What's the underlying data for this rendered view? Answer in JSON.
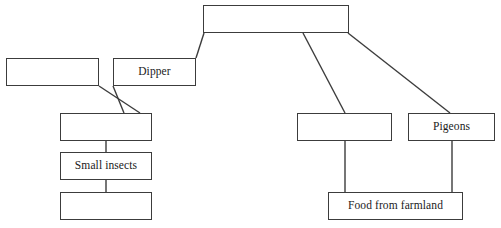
{
  "diagram": {
    "type": "food-web-fill-in-the-blank",
    "background_color": "#ffffff",
    "box_border_color": "#3c3c3c",
    "link_color": "#3c3c3c",
    "text_color": "#1a1a1a",
    "nodes": [
      {
        "id": "top",
        "label": "",
        "x": 203,
        "y": 5,
        "w": 146,
        "h": 28,
        "blank": true
      },
      {
        "id": "left-upper",
        "label": "",
        "x": 6,
        "y": 58,
        "w": 93,
        "h": 28,
        "blank": true
      },
      {
        "id": "dipper",
        "label": "Dipper",
        "x": 113,
        "y": 58,
        "w": 83,
        "h": 28,
        "blank": false
      },
      {
        "id": "left-mid",
        "label": "",
        "x": 60,
        "y": 113,
        "w": 92,
        "h": 28,
        "blank": true
      },
      {
        "id": "small-insects",
        "label": "Small insects",
        "x": 60,
        "y": 152,
        "w": 92,
        "h": 28,
        "blank": false
      },
      {
        "id": "left-bottom",
        "label": "",
        "x": 60,
        "y": 192,
        "w": 92,
        "h": 28,
        "blank": true
      },
      {
        "id": "right-mid",
        "label": "",
        "x": 297,
        "y": 113,
        "w": 95,
        "h": 28,
        "blank": true
      },
      {
        "id": "pigeons",
        "label": "Pigeons",
        "x": 408,
        "y": 113,
        "w": 87,
        "h": 28,
        "blank": false
      },
      {
        "id": "food-from-farmland",
        "label": "Food from farmland",
        "x": 328,
        "y": 192,
        "w": 135,
        "h": 28,
        "blank": false
      }
    ],
    "links": [
      {
        "id": "top-to-dipper",
        "from": "top",
        "to": "dipper",
        "x1": 204,
        "y1": 33,
        "x2": 196,
        "y2": 58
      },
      {
        "id": "top-to-right-mid",
        "from": "top",
        "to": "right-mid",
        "x1": 303,
        "y1": 33,
        "x2": 345,
        "y2": 113
      },
      {
        "id": "top-to-pigeons",
        "from": "top",
        "to": "pigeons",
        "x1": 348,
        "y1": 33,
        "x2": 450,
        "y2": 113
      },
      {
        "id": "left-upper-to-left-mid",
        "from": "left-upper",
        "to": "left-mid",
        "x1": 99,
        "y1": 86,
        "x2": 140,
        "y2": 113
      },
      {
        "id": "dipper-to-left-mid",
        "from": "dipper",
        "to": "left-mid",
        "x1": 113,
        "y1": 86,
        "x2": 124,
        "y2": 113
      },
      {
        "id": "left-mid-to-small-insects",
        "from": "left-mid",
        "to": "small-insects",
        "x1": 106,
        "y1": 141,
        "x2": 106,
        "y2": 152
      },
      {
        "id": "small-insects-to-left-bottom",
        "from": "small-insects",
        "to": "left-bottom",
        "x1": 106,
        "y1": 180,
        "x2": 106,
        "y2": 192
      },
      {
        "id": "right-mid-to-food",
        "from": "right-mid",
        "to": "food-from-farmland",
        "x1": 345,
        "y1": 141,
        "x2": 345,
        "y2": 192
      },
      {
        "id": "pigeons-to-food",
        "from": "pigeons",
        "to": "food-from-farmland",
        "x1": 452,
        "y1": 141,
        "x2": 452,
        "y2": 192
      }
    ]
  }
}
